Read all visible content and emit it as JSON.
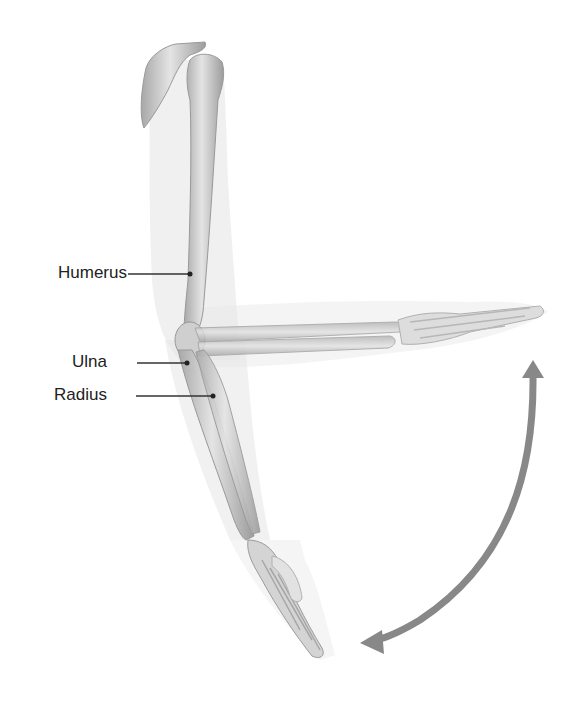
{
  "figure": {
    "labels": [
      {
        "id": "humerus",
        "text": "Humerus"
      },
      {
        "id": "ulna",
        "text": "Ulna"
      },
      {
        "id": "radius",
        "text": "Radius"
      }
    ],
    "colors": {
      "bone": "#d6d6d6",
      "bone_shade": "#9a9a9a",
      "soft_tissue": "#e6e6e6",
      "arrow": "#888888",
      "leader": "#333333",
      "label_text": "#222222"
    },
    "arrow": {
      "type": "double-headed-curved",
      "meaning": "range of motion"
    }
  }
}
